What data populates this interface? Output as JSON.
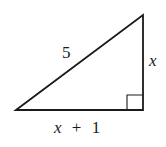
{
  "diagram": {
    "type": "right-triangle",
    "hypotenuse_label": "5",
    "vertical_leg_label": "x",
    "horizontal_leg": {
      "var": "x",
      "op": "+",
      "num": "1"
    },
    "right_angle_marker": "bottom-right",
    "stroke_color": "#1a1a1a",
    "background": "#ffffff"
  }
}
